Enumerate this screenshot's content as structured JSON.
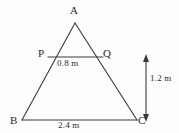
{
  "figure": {
    "kind": "geometry-diagram",
    "background_color": "#fdfdfd",
    "stroke_color": "#3a3a3a",
    "text_color": "#2b2b2b",
    "vertices": {
      "A": {
        "label": "A",
        "x": 75,
        "y": 23
      },
      "B": {
        "label": "B",
        "x": 22,
        "y": 120
      },
      "C": {
        "label": "C",
        "x": 137,
        "y": 120
      },
      "P": {
        "label": "P",
        "x": 48,
        "y": 57
      },
      "Q": {
        "label": "Q",
        "x": 103,
        "y": 57
      }
    },
    "segments": [
      {
        "name": "side-AB",
        "from": "A",
        "to": "B"
      },
      {
        "name": "side-AC",
        "from": "A",
        "to": "C"
      },
      {
        "name": "base-BC",
        "from": "B",
        "to": "C"
      },
      {
        "name": "segment-PQ",
        "from": "P",
        "to": "Q"
      }
    ],
    "dimensions": {
      "pq_length": "0.8 m",
      "bc_length": "2.4 m",
      "height": "1.2 m"
    },
    "height_arrow": {
      "name": "height-dimension-arrow",
      "x": 146,
      "y_top": 56,
      "y_bottom": 120,
      "style": "double-headed-vertical"
    }
  }
}
